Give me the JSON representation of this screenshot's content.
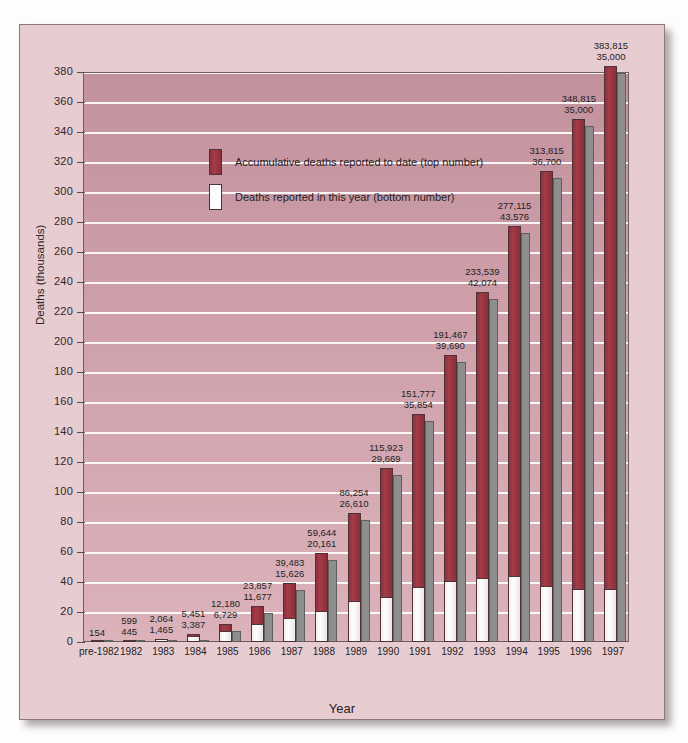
{
  "chart_data": {
    "type": "bar",
    "title": "",
    "xlabel": "Year",
    "ylabel": "Deaths (thousands)",
    "ylim": [
      0,
      380
    ],
    "ytick_step": 20,
    "grid": true,
    "legend_position": "inside-upper-left",
    "note": "(projected numbers)",
    "note_applies_to": [
      "1995",
      "1996",
      "1997"
    ],
    "categories": [
      "pre-1982",
      "1982",
      "1983",
      "1984",
      "1985",
      "1986",
      "1987",
      "1988",
      "1989",
      "1990",
      "1991",
      "1992",
      "1993",
      "1994",
      "1995",
      "1996",
      "1997"
    ],
    "yticks": [
      0,
      20,
      40,
      60,
      80,
      100,
      120,
      140,
      160,
      180,
      200,
      220,
      240,
      260,
      280,
      300,
      320,
      340,
      360,
      380
    ],
    "series": [
      {
        "name": "Accumulative deaths reported to date (top number)",
        "color": "#9c3340",
        "values": [
          154,
          599,
          2064,
          5451,
          12180,
          23857,
          39483,
          59644,
          86254,
          115923,
          151777,
          191467,
          233539,
          277115,
          313815,
          348815,
          383815
        ]
      },
      {
        "name": "Deaths reported in this year (bottom number)",
        "color": "#ffffff",
        "values": [
          null,
          445,
          1465,
          3387,
          6729,
          11677,
          15626,
          20161,
          26610,
          29669,
          35854,
          39690,
          42074,
          43576,
          36700,
          35000,
          35000
        ]
      }
    ],
    "point_labels": [
      {
        "category": "pre-1982",
        "top": "154",
        "bottom": ""
      },
      {
        "category": "1982",
        "top": "599",
        "bottom": "445"
      },
      {
        "category": "1983",
        "top": "2,064",
        "bottom": "1,465"
      },
      {
        "category": "1984",
        "top": "5,451",
        "bottom": "3,387"
      },
      {
        "category": "1985",
        "top": "12,180",
        "bottom": "6,729"
      },
      {
        "category": "1986",
        "top": "23,857",
        "bottom": "11,677"
      },
      {
        "category": "1987",
        "top": "39,483",
        "bottom": "15,626"
      },
      {
        "category": "1988",
        "top": "59,644",
        "bottom": "20,161"
      },
      {
        "category": "1989",
        "top": "86,254",
        "bottom": "26,610"
      },
      {
        "category": "1990",
        "top": "115,923",
        "bottom": "29,669"
      },
      {
        "category": "1991",
        "top": "151,777",
        "bottom": "35,854"
      },
      {
        "category": "1992",
        "top": "191,467",
        "bottom": "39,690"
      },
      {
        "category": "1993",
        "top": "233,539",
        "bottom": "42,074"
      },
      {
        "category": "1994",
        "top": "277,115",
        "bottom": "43,576"
      },
      {
        "category": "1995",
        "top": "313,815",
        "bottom": "36,700"
      },
      {
        "category": "1996",
        "top": "348,815",
        "bottom": "35,000"
      },
      {
        "category": "1997",
        "top": "383,815",
        "bottom": "35,000"
      }
    ]
  },
  "legend": {
    "items": [
      {
        "label": "Accumulative deaths reported to date (top number)",
        "swatch": "#9c3340"
      },
      {
        "label": "Deaths reported in this year (bottom number)",
        "swatch": "#ffffff"
      }
    ]
  },
  "colors": {
    "page_background": "#fdfdfd",
    "card_background": "#e8ccd1",
    "plot_background": "#cf9fa9",
    "gridline": "#ffffff",
    "accumulative_bar": "#9c3340",
    "yearly_bar": "#ffffff",
    "bar_shadow_3d": "#8d8d8d",
    "text": "#201a1c",
    "axis_line": "#54464a"
  }
}
